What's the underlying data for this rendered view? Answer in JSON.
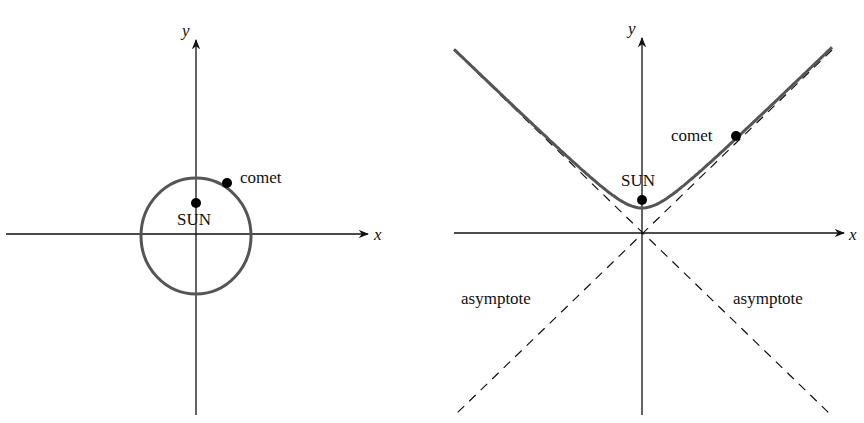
{
  "panels": [
    {
      "name": "elliptical-orbit",
      "x_axis_label": "x",
      "y_axis_label": "y",
      "sun_label": "SUN",
      "comet_label": "comet",
      "curve_type": "ellipse"
    },
    {
      "name": "hyperbolic-orbit",
      "x_axis_label": "x",
      "y_axis_label": "y",
      "sun_label": "SUN",
      "comet_label": "comet",
      "asymptote_left_label": "asymptote",
      "asymptote_right_label": "asymptote",
      "curve_type": "hyperbola"
    }
  ],
  "colors": {
    "axis": "#111111",
    "curve": "#555555",
    "point": "#000000"
  }
}
